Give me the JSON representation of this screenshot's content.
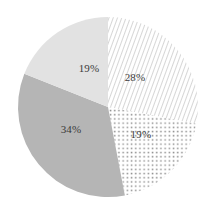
{
  "chart_data": {
    "type": "pie",
    "title": "",
    "subtitle": "",
    "xlabel": "",
    "ylabel": "",
    "legend": "none",
    "grid": false,
    "start_angle_deg": 0,
    "direction": "clockwise",
    "categories": [
      "28%",
      "19%",
      "34%",
      "19%"
    ],
    "values": [
      28,
      19,
      34,
      19
    ],
    "total": 100,
    "slices": [
      {
        "label": "28%",
        "value": 28,
        "fill_style": "diagonal-hatch",
        "fill_color": "#ffffff",
        "pattern_color": "#c9c9c9",
        "label_x_pct": 63.7,
        "label_y_pct": 36.2
      },
      {
        "label": "19%",
        "value": 19,
        "fill_style": "dotted",
        "fill_color": "#ffffff",
        "pattern_color": "#9a9a9a",
        "label_x_pct": 66.5,
        "label_y_pct": 62.9
      },
      {
        "label": "34%",
        "value": 34,
        "fill_style": "solid",
        "fill_color": "#b5b5b5",
        "pattern_color": "",
        "label_x_pct": 33.5,
        "label_y_pct": 60.5
      },
      {
        "label": "19%",
        "value": 19,
        "fill_style": "solid",
        "fill_color": "#e2e2e2",
        "pattern_color": "",
        "label_x_pct": 42.0,
        "label_y_pct": 32.0
      }
    ],
    "geometry": {
      "center_x": 108,
      "center_y": 107,
      "radius": 90
    },
    "colors": {
      "background": "#ffffff",
      "label_text": "#3a3a3a",
      "solid_dark": "#b5b5b5",
      "solid_light": "#e2e2e2"
    }
  }
}
